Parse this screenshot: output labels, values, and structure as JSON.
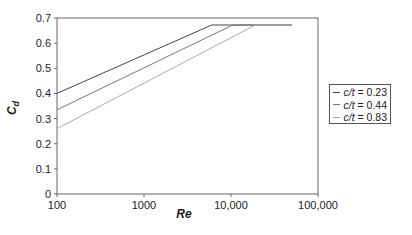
{
  "chart_data": {
    "type": "line",
    "title": "",
    "xlabel": "Re",
    "ylabel": "C_d",
    "xscale": "log",
    "xlim": [
      100,
      100000
    ],
    "ylim": [
      0,
      0.7
    ],
    "x_ticks": [
      "100",
      "1000",
      "10,000",
      "100,000"
    ],
    "y_ticks": [
      "0",
      "0.1",
      "0.2",
      "0.3",
      "0.4",
      "0.5",
      "0.6",
      "0.7"
    ],
    "grid": false,
    "legend_position": "right",
    "series": [
      {
        "name": "c/t = 0.23",
        "color": "#444444",
        "x": [
          100,
          6000,
          50000
        ],
        "y": [
          0.4,
          0.672,
          0.672
        ]
      },
      {
        "name": "c/t = 0.44",
        "color": "#777777",
        "x": [
          100,
          10500,
          50000
        ],
        "y": [
          0.335,
          0.672,
          0.672
        ]
      },
      {
        "name": "c/t = 0.83",
        "color": "#aaaaaa",
        "x": [
          100,
          19000,
          50000
        ],
        "y": [
          0.26,
          0.672,
          0.672
        ]
      }
    ]
  },
  "legend": {
    "items": [
      {
        "label_prefix": "c/t",
        "label_value": " = 0.23",
        "color": "#444444"
      },
      {
        "label_prefix": "c/t",
        "label_value": " = 0.44",
        "color": "#777777"
      },
      {
        "label_prefix": "c/t",
        "label_value": " = 0.83",
        "color": "#aaaaaa"
      }
    ]
  },
  "axes": {
    "x_label": "Re",
    "y_label_main": "C",
    "y_label_sub": "d"
  }
}
